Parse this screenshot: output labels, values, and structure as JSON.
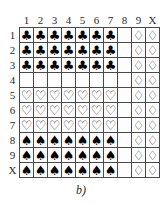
{
  "figure": {
    "caption": "b)",
    "column_headers": [
      "1",
      "2",
      "3",
      "4",
      "5",
      "6",
      "7",
      "8",
      "9",
      "X"
    ],
    "row_headers": [
      "1",
      "2",
      "3",
      "4",
      "5",
      "6",
      "7",
      "8",
      "9",
      "X"
    ],
    "glyphs": {
      "club": "♣",
      "heart": "♡",
      "spade": "♠",
      "diamond": "♢",
      "blank": ""
    },
    "glyph_names": {
      "club": "club-suit-icon",
      "heart": "heart-suit-icon",
      "spade": "spade-suit-icon",
      "diamond": "diamond-suit-icon",
      "blank": "empty-cell"
    },
    "colors": {
      "grid_line": "#4a4a4a",
      "cell_background": "#fdfdfd",
      "filled_glyph": "#000000",
      "hollow_glyph": "#3c3c3c",
      "label_text": "#2b2b2b",
      "page_background": "#ffffff"
    },
    "rows": [
      {
        "header": "1",
        "cells": [
          "club",
          "club",
          "club",
          "club",
          "club",
          "club",
          "club",
          "blank",
          "diamond",
          "diamond"
        ]
      },
      {
        "header": "2",
        "cells": [
          "club",
          "club",
          "club",
          "club",
          "club",
          "club",
          "club",
          "blank",
          "diamond",
          "diamond"
        ]
      },
      {
        "header": "3",
        "cells": [
          "club",
          "club",
          "club",
          "club",
          "club",
          "club",
          "club",
          "blank",
          "diamond",
          "diamond"
        ]
      },
      {
        "header": "4",
        "cells": [
          "blank",
          "blank",
          "blank",
          "blank",
          "blank",
          "blank",
          "blank",
          "blank",
          "diamond",
          "diamond"
        ]
      },
      {
        "header": "5",
        "cells": [
          "heart",
          "heart",
          "heart",
          "heart",
          "heart",
          "heart",
          "heart",
          "blank",
          "diamond",
          "diamond"
        ]
      },
      {
        "header": "6",
        "cells": [
          "heart",
          "heart",
          "heart",
          "heart",
          "heart",
          "heart",
          "heart",
          "blank",
          "diamond",
          "diamond"
        ]
      },
      {
        "header": "7",
        "cells": [
          "heart",
          "heart",
          "heart",
          "heart",
          "heart",
          "heart",
          "heart",
          "blank",
          "diamond",
          "diamond"
        ]
      },
      {
        "header": "8",
        "cells": [
          "spade",
          "spade",
          "spade",
          "spade",
          "spade",
          "spade",
          "spade",
          "blank",
          "diamond",
          "diamond"
        ]
      },
      {
        "header": "9",
        "cells": [
          "spade",
          "spade",
          "spade",
          "spade",
          "spade",
          "spade",
          "spade",
          "blank",
          "diamond",
          "diamond"
        ]
      },
      {
        "header": "X",
        "cells": [
          "spade",
          "spade",
          "spade",
          "spade",
          "spade",
          "spade",
          "spade",
          "blank",
          "diamond",
          "diamond"
        ]
      }
    ]
  }
}
